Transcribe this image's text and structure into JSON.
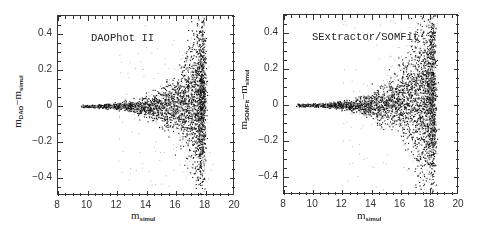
{
  "chart_data": [
    {
      "type": "scatter",
      "panel_title": "DAOPhot II",
      "xlabel": {
        "base": "m",
        "sub": "simul"
      },
      "ylabel": {
        "base": "m",
        "sub1": "DAO",
        "minus": "−",
        "base2": "m",
        "sub2": "simul"
      },
      "xlim": [
        8,
        20
      ],
      "ylim": [
        -0.5,
        0.5
      ],
      "xticks": [
        8,
        10,
        12,
        14,
        16,
        18,
        20
      ],
      "xtick_labels": [
        "8",
        "10",
        "12",
        "14",
        "16",
        "18",
        "20"
      ],
      "yticks": [
        0.4,
        0.2,
        0,
        -0.2,
        -0.4
      ],
      "ytick_labels": [
        "0.4",
        "0.2",
        "0",
        "−0.2",
        "−0.4"
      ],
      "minor_ticks": true,
      "grid": false,
      "legend": null,
      "description": "Residuals (measured minus simulated magnitude) vs simulated magnitude. Tight near zero for m<14, fanning out with increasing scatter toward m~17.5; dense cloud between m=15-17.5, cutoff near m~17.8.",
      "distribution": {
        "x_start": 9.7,
        "x_cutoff": 17.8,
        "dense_region_x": [
          15,
          17.5
        ],
        "spread_at_x": [
          {
            "x": 10,
            "sigma": 0.003
          },
          {
            "x": 12,
            "sigma": 0.008
          },
          {
            "x": 13,
            "sigma": 0.015
          },
          {
            "x": 14,
            "sigma": 0.03
          },
          {
            "x": 15,
            "sigma": 0.05
          },
          {
            "x": 16,
            "sigma": 0.08
          },
          {
            "x": 17,
            "sigma": 0.15
          },
          {
            "x": 17.5,
            "sigma": 0.22
          }
        ],
        "mean_offset": 0.0,
        "approx_points": 4000,
        "seed": 7
      }
    },
    {
      "type": "scatter",
      "panel_title": "SExtractor/SOMFit",
      "xlabel": {
        "base": "m",
        "sub": "simul"
      },
      "ylabel": {
        "base": "m",
        "sub1": "SOMFit",
        "minus": "−",
        "base2": "m",
        "sub2": "simul"
      },
      "xlim": [
        8,
        20
      ],
      "ylim": [
        -0.5,
        0.5
      ],
      "xticks": [
        8,
        10,
        12,
        14,
        16,
        18,
        20
      ],
      "xtick_labels": [
        "8",
        "10",
        "12",
        "14",
        "16",
        "18",
        "20"
      ],
      "yticks": [
        0.4,
        0.2,
        0,
        -0.2,
        -0.4
      ],
      "ytick_labels": [
        "0.4",
        "0.2",
        "0",
        "−0.2",
        "−0.4"
      ],
      "minor_ticks": true,
      "grid": false,
      "legend": null,
      "description": "Residuals (measured minus simulated magnitude) vs simulated magnitude. Similar fan shape; slightly broader, with upward-extending tail to >0.4 near m~17.5 and cutoff near m~18.2.",
      "distribution": {
        "x_start": 9.0,
        "x_cutoff": 18.2,
        "dense_region_x": [
          15,
          17.8
        ],
        "spread_at_x": [
          {
            "x": 10,
            "sigma": 0.004
          },
          {
            "x": 12,
            "sigma": 0.01
          },
          {
            "x": 13,
            "sigma": 0.018
          },
          {
            "x": 14,
            "sigma": 0.035
          },
          {
            "x": 15,
            "sigma": 0.06
          },
          {
            "x": 16,
            "sigma": 0.09
          },
          {
            "x": 17,
            "sigma": 0.16
          },
          {
            "x": 18,
            "sigma": 0.25
          }
        ],
        "mean_offset": 0.02,
        "approx_points": 4500,
        "seed": 11
      }
    }
  ],
  "panels": [
    {
      "title": "DAOPhot II"
    },
    {
      "title": "SExtractor/SOMFit"
    }
  ],
  "colors": {
    "points": "#111111",
    "faint_points": "#bbbbbb",
    "axes": "#333333"
  }
}
